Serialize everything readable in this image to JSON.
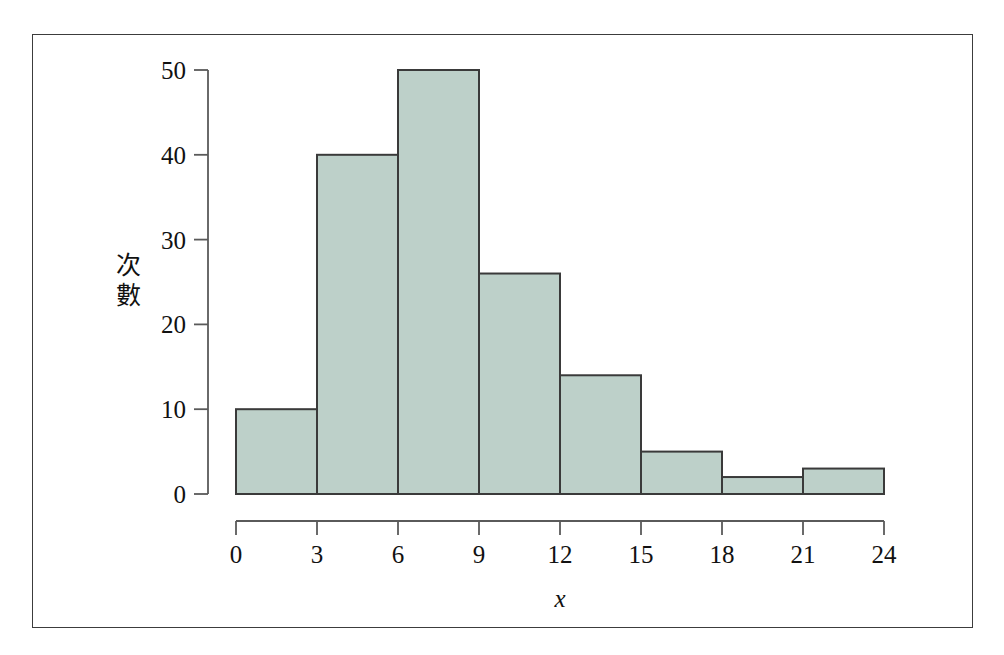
{
  "figure": {
    "frame_color": "#3c3c3c",
    "background": "#ffffff"
  },
  "chart_data": {
    "type": "bar",
    "subtype": "histogram",
    "title": "",
    "xlabel": "x",
    "ylabel_lines": [
      "次",
      "數"
    ],
    "ylabel": "次數",
    "bin_width": 3,
    "bin_edges": [
      0,
      3,
      6,
      9,
      12,
      15,
      18,
      21,
      24
    ],
    "categories": [
      "0-3",
      "3-6",
      "6-9",
      "9-12",
      "12-15",
      "15-18",
      "18-21",
      "21-24"
    ],
    "values": [
      10,
      40,
      50,
      26,
      14,
      5,
      2,
      3
    ],
    "xlim": [
      0,
      24
    ],
    "ylim": [
      0,
      50
    ],
    "xticks": [
      0,
      3,
      6,
      9,
      12,
      15,
      18,
      21,
      24
    ],
    "yticks": [
      0,
      10,
      20,
      30,
      40,
      50
    ],
    "xtick_labels": [
      "0",
      "3",
      "6",
      "9",
      "12",
      "15",
      "18",
      "21",
      "24"
    ],
    "ytick_labels": [
      "0",
      "10",
      "20",
      "30",
      "40",
      "50"
    ],
    "grid": false,
    "legend": null,
    "bar_fill_color": "#bdd0c9",
    "bar_edge_color": "#3a3a3a",
    "axis_color": "#5a5a5a"
  }
}
